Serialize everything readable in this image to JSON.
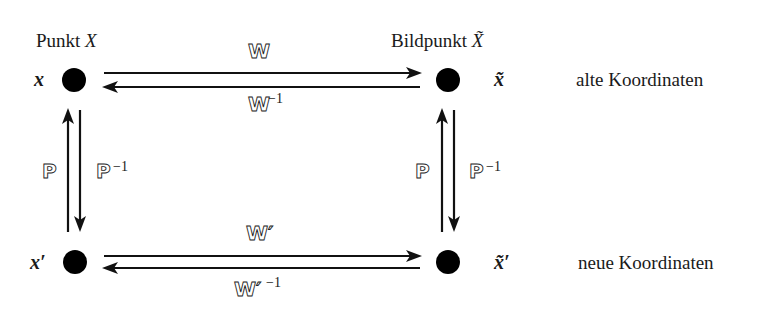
{
  "diagram": {
    "nodes": [
      {
        "id": "x",
        "label": "x",
        "title": "Punkt X",
        "row": "top",
        "col": "left"
      },
      {
        "id": "x_tilde",
        "label": "x̃",
        "title": "Bildpunkt X̃",
        "row": "top",
        "col": "right"
      },
      {
        "id": "x_prime",
        "label": "x′",
        "row": "bottom",
        "col": "left"
      },
      {
        "id": "x_tilde_prime",
        "label": "x̃′",
        "row": "bottom",
        "col": "right"
      }
    ],
    "titles": {
      "left": {
        "text": "Punkt ",
        "var": "X"
      },
      "right": {
        "text": "Bildpunkt ",
        "var": "X̃"
      }
    },
    "row_labels": {
      "top": "alte Koordinaten",
      "bottom": "neue Koordinaten"
    },
    "edges": {
      "top_forward": {
        "from": "x",
        "to": "x_tilde",
        "label": "W",
        "sup": ""
      },
      "top_backward": {
        "from": "x_tilde",
        "to": "x",
        "label": "W",
        "sup": "−1"
      },
      "bottom_forward": {
        "from": "x_prime",
        "to": "x_tilde_prime",
        "label": "W′",
        "sup": ""
      },
      "bottom_backward": {
        "from": "x_tilde_prime",
        "to": "x_prime",
        "label": "W′",
        "sup": "−1"
      },
      "left_up": {
        "from": "x_prime",
        "to": "x",
        "label": "P",
        "sup": ""
      },
      "left_down": {
        "from": "x",
        "to": "x_prime",
        "label": "P",
        "sup": "−1"
      },
      "right_up": {
        "from": "x_tilde_prime",
        "to": "x_tilde",
        "label": "P",
        "sup": ""
      },
      "right_down": {
        "from": "x_tilde",
        "to": "x_tilde_prime",
        "label": "P",
        "sup": "−1"
      }
    }
  }
}
